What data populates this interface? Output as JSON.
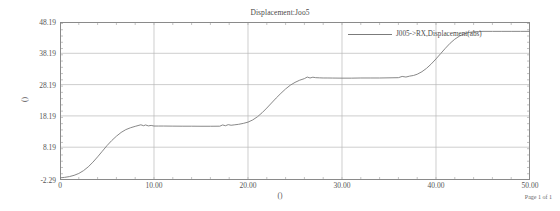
{
  "chart_data": {
    "type": "line",
    "title": "Displacement:Joo5",
    "xlabel": "()",
    "ylabel": "()",
    "xlim": [
      0,
      50
    ],
    "ylim": [
      -2.29,
      48.19
    ],
    "grid": true,
    "legend_position": "top-right",
    "x_ticks": [
      "0",
      "10.00",
      "20.00",
      "30.00",
      "40.00",
      "50.00"
    ],
    "x_tick_values": [
      0,
      10,
      20,
      30,
      40,
      50
    ],
    "y_ticks": [
      "-2.29",
      "8.19",
      "18.19",
      "28.19",
      "38.19",
      "48.19"
    ],
    "y_tick_values": [
      -2.29,
      8.19,
      18.19,
      28.19,
      38.19,
      48.19
    ],
    "x_minor_tick_step": 2,
    "y_minor_tick_step": 2,
    "series": [
      {
        "name": "J005->RX,Displacement(abs)",
        "color": "#7b7b7b",
        "x": [
          0,
          0.5,
          1,
          1.5,
          2,
          2.5,
          3,
          3.5,
          4,
          4.5,
          5,
          5.5,
          6,
          6.5,
          7,
          7.5,
          8,
          8.3,
          8.6,
          8.9,
          9.1,
          9.4,
          9.7,
          10,
          10.5,
          11,
          12,
          13,
          14,
          15,
          16,
          17,
          17.3,
          17.6,
          17.9,
          18.2,
          18.6,
          19,
          19.5,
          20,
          20.5,
          21,
          21.5,
          22,
          22.5,
          23,
          23.5,
          24,
          24.5,
          25,
          25.5,
          26,
          26.3,
          26.6,
          26.9,
          27.2,
          27.6,
          28,
          28.5,
          29,
          30,
          31,
          32,
          33,
          34,
          35,
          36,
          36.4,
          36.8,
          37.2,
          37.6,
          38,
          38.5,
          39,
          39.5,
          40,
          40.5,
          41,
          41.5,
          42,
          42.5,
          43,
          43.5,
          44,
          44.5,
          45,
          46,
          47,
          48,
          49,
          50
        ],
        "y": [
          -1.6,
          -1.45,
          -1.2,
          -0.8,
          -0.2,
          0.7,
          1.9,
          3.4,
          5.1,
          6.9,
          8.7,
          10.3,
          11.7,
          12.9,
          13.8,
          14.4,
          14.85,
          15.1,
          15.35,
          15.05,
          15.3,
          15.0,
          15.15,
          14.95,
          14.95,
          14.95,
          14.92,
          14.9,
          14.9,
          14.88,
          14.88,
          14.9,
          15.3,
          15.05,
          15.4,
          15.2,
          15.35,
          15.5,
          15.8,
          16.2,
          16.9,
          17.9,
          19.2,
          20.7,
          22.3,
          23.9,
          25.4,
          26.8,
          28.0,
          28.9,
          29.6,
          30.1,
          30.6,
          30.3,
          30.55,
          30.4,
          30.35,
          30.3,
          30.3,
          30.28,
          30.25,
          30.25,
          30.3,
          30.3,
          30.3,
          30.35,
          30.4,
          30.8,
          30.6,
          30.9,
          31.1,
          31.5,
          32.3,
          33.4,
          34.8,
          36.4,
          38.1,
          39.8,
          41.4,
          42.7,
          43.7,
          44.4,
          44.85,
          45.05,
          45.15,
          45.2,
          45.2,
          45.2,
          45.2,
          45.2,
          45.2
        ]
      }
    ]
  },
  "footer": {
    "page_label": "Page 1 of 1"
  }
}
